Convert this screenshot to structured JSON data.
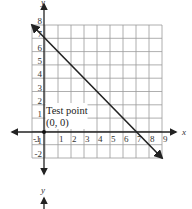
{
  "chart_data": {
    "type": "line",
    "title": "",
    "xlabel": "x",
    "ylabel": "y",
    "xlim": [
      -1,
      9
    ],
    "ylim": [
      -2,
      8
    ],
    "grid": true,
    "x_ticks": [
      "-1",
      "1",
      "2",
      "3",
      "4",
      "5",
      "6",
      "7",
      "8",
      "9"
    ],
    "y_ticks": [
      "8",
      "7",
      "6",
      "5",
      "4",
      "3",
      "2",
      "1",
      "-1",
      "-2"
    ],
    "series": [
      {
        "name": "boundary line y = -x + 7",
        "x": [
          -1,
          9
        ],
        "y": [
          8,
          -2
        ],
        "style": "solid, arrows both ends"
      }
    ],
    "points": [
      {
        "label": "Test point (0, 0)",
        "x": 0,
        "y": 0
      }
    ],
    "annotations": [
      {
        "text_line1": "Test point",
        "text_line2": "(0, 0)"
      }
    ],
    "secondary_axis_label": "y"
  },
  "colors": {
    "grid": "#9a9a9a",
    "axis": "#222222",
    "line": "#222222",
    "background": "#ffffff"
  }
}
